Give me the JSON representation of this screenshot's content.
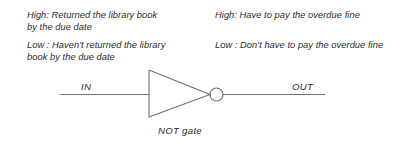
{
  "figure": {
    "background_color": "#ffffff",
    "line_color": "#6f6f6f",
    "text_color": "#2b2b2b"
  },
  "left_column": {
    "high": {
      "line1": "High: Returned the library book",
      "line2": "by the due date"
    },
    "low": {
      "line1": "Low : Haven't returned the library",
      "line2": "book by the due date"
    }
  },
  "right_column": {
    "high": {
      "line1": "High: Have to pay the overdue fine"
    },
    "low": {
      "line1": "Low : Don't have to pay the overdue fine"
    }
  },
  "circuit": {
    "input_label": "IN",
    "output_label": "OUT",
    "gate_label": "NOT gate",
    "gate_type": "NOT",
    "symbol": {
      "triangle_back_x": 149,
      "triangle_top_y": 70,
      "triangle_bottom_y": 117,
      "triangle_apex_x": 210,
      "centerline_y": 94.5,
      "bubble_center_x": 216.5,
      "bubble_radius": 6.5,
      "input_wire_x_start": 60,
      "output_wire_x_end": 325
    }
  }
}
